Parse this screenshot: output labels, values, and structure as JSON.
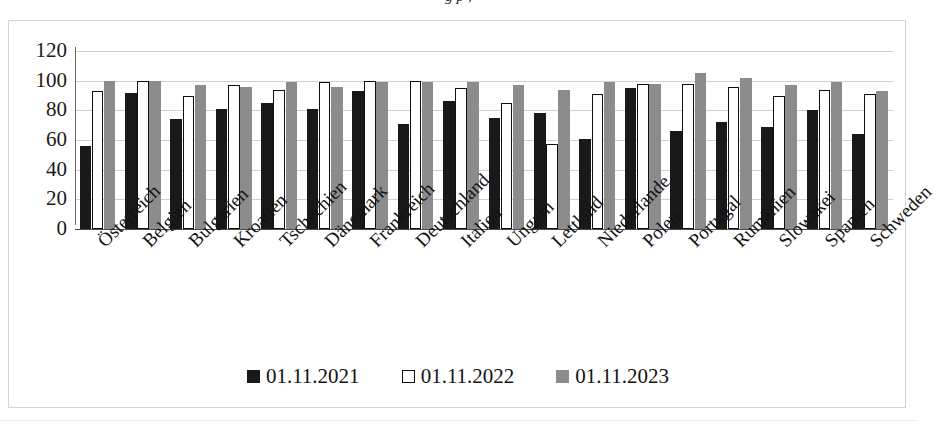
{
  "document": {
    "top_cut_text": "g                 p   ,"
  },
  "chart_data": {
    "type": "bar",
    "title": "",
    "subtitle": "",
    "xlabel": "",
    "ylabel": "",
    "ylim": [
      0,
      120
    ],
    "y_ticks": [
      0,
      20,
      40,
      60,
      80,
      100,
      120
    ],
    "y_tick_labels": [
      "0",
      "20",
      "40",
      "60",
      "80",
      "100",
      "120"
    ],
    "grid": true,
    "legend_position": "bottom",
    "categories": [
      "Österreich",
      "Belgien",
      "Bulgarien",
      "Kroatien",
      "Tschechien",
      "Dänemark",
      "Frankreich",
      "Deutschland",
      "Italien",
      "Ungarn",
      "Lettland",
      "Niederlande",
      "Polen",
      "Portugal",
      "Rumänien",
      "Slowakei",
      "Spanien",
      "Schweden"
    ],
    "series": [
      {
        "name": "01.11.2021",
        "color": "#191919",
        "values": [
          56,
          92,
          74,
          81,
          85,
          81,
          93,
          71,
          86,
          75,
          78,
          61,
          95,
          66,
          72,
          69,
          80,
          64
        ]
      },
      {
        "name": "01.11.2022",
        "color": "#ffffff",
        "values": [
          93,
          100,
          90,
          97,
          94,
          99,
          100,
          100,
          95,
          85,
          57,
          91,
          98,
          98,
          96,
          90,
          94,
          91
        ]
      },
      {
        "name": "01.11.2023",
        "color": "#8c8c8c",
        "values": [
          100,
          100,
          97,
          96,
          99,
          96,
          99,
          99,
          99,
          97,
          94,
          99,
          98,
          105,
          102,
          97,
          99,
          93
        ]
      }
    ]
  },
  "legend": {
    "items": [
      {
        "label": "01.11.2021",
        "swatch": "filled-black-square-icon"
      },
      {
        "label": "01.11.2022",
        "swatch": "outlined-white-square-icon"
      },
      {
        "label": "01.11.2023",
        "swatch": "filled-gray-square-icon"
      }
    ]
  }
}
